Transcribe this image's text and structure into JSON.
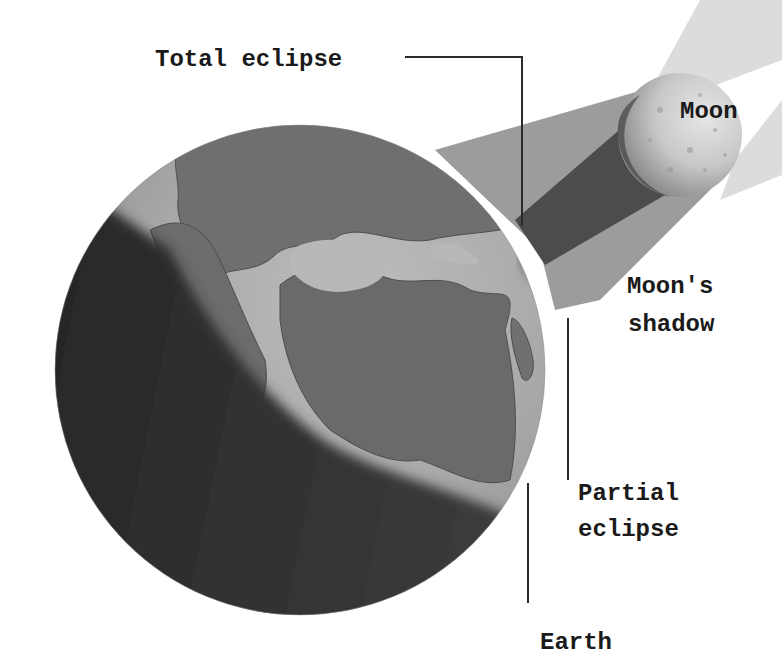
{
  "diagram": {
    "type": "solar-eclipse-illustration",
    "labels": {
      "total_eclipse": "Total eclipse",
      "moon": "Moon",
      "moons_shadow_line1": "Moon's",
      "moons_shadow_line2": "shadow",
      "partial_eclipse_line1": "Partial",
      "partial_eclipse_line2": "eclipse",
      "earth": "Earth"
    },
    "colors": {
      "background": "#ffffff",
      "label_text": "#1a1a1a",
      "leader_line": "#2a2a2a",
      "earth_ocean_lit": "#b4b4b4",
      "earth_land": "#6e6e6e",
      "earth_night": "#2e2e2e",
      "penumbra": "#9a9a9a",
      "umbra": "#4a4a4a",
      "sunlight_beam": "#d4d4d4",
      "moon_lit": "#d8d8d8",
      "moon_dark": "#5a5a5a"
    }
  }
}
